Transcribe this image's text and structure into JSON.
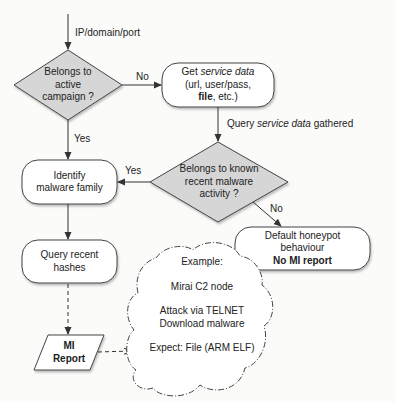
{
  "diagram": {
    "start": {
      "label": "IP/domain/port"
    },
    "decision_active_campaign": {
      "lines": [
        "Belongs to",
        "active",
        "campaign ?"
      ],
      "no_label": "No",
      "yes_label": "Yes"
    },
    "get_service_data": {
      "line1_prefix": "Get ",
      "line1_italic": "service data",
      "line2": "(url, user/pass,",
      "line3_bold": "file",
      "line3_rest": ", etc.)"
    },
    "query_edge": {
      "prefix": "Query ",
      "italic": "service data",
      "suffix": " gathered"
    },
    "decision_known_malware": {
      "lines": [
        "Belongs to known",
        "recent malware",
        "activity ?"
      ],
      "yes_label": "Yes",
      "no_label": "No"
    },
    "identify_family": {
      "lines": [
        "Identify",
        "malware family"
      ]
    },
    "query_hashes": {
      "lines": [
        "Query recent",
        "hashes"
      ]
    },
    "default_honeypot": {
      "lines": [
        "Default honeypot",
        "behaviour"
      ],
      "bold_line": "No MI report"
    },
    "mi_report": {
      "lines": [
        "MI",
        "Report"
      ]
    },
    "example_cloud": {
      "title": "Example:",
      "node": "Mirai C2 node",
      "attack_lines": [
        "Attack via TELNET",
        "Download malware"
      ],
      "expect": "Expect: File (ARM ELF)"
    },
    "colors": {
      "decision_fill": "#d6d6d6",
      "box_fill": "#ffffff",
      "stroke": "#333333",
      "background": "#fbfbfa"
    }
  }
}
